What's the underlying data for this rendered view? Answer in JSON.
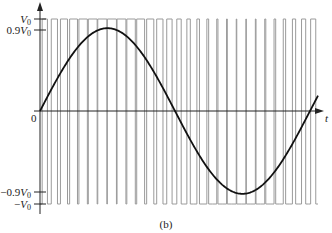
{
  "figure": {
    "caption": "(b)",
    "axes": {
      "x_label": "t",
      "origin_label": "0",
      "y_ticks": [
        {
          "label": "V",
          "sub": "0",
          "prefix": "",
          "value": 1.0
        },
        {
          "label": "V",
          "sub": "0",
          "prefix": "0.9",
          "value": 0.9
        },
        {
          "label": "V",
          "sub": "0",
          "prefix": "−0.9",
          "value": -0.9
        },
        {
          "label": "V",
          "sub": "0",
          "prefix": "−",
          "value": -1.0
        }
      ]
    },
    "colors": {
      "axis": "#222222",
      "pulse_lines": "#9a9a9a",
      "sine": "#111111"
    }
  },
  "chart_data": {
    "type": "line",
    "title": "",
    "xlabel": "t",
    "ylabel": "",
    "ytick_labels": [
      "V0",
      "0.9V0",
      "0",
      "-0.9V0",
      "-V0"
    ],
    "ylim": [
      -1.0,
      1.0
    ],
    "series": [
      {
        "name": "sinusoid",
        "amplitude": 0.9,
        "cycles_shown": 1.07
      },
      {
        "name": "PWM pulses",
        "levels": [
          1.0,
          -1.0
        ],
        "edge_count": 58
      }
    ],
    "caption": "(b)"
  }
}
